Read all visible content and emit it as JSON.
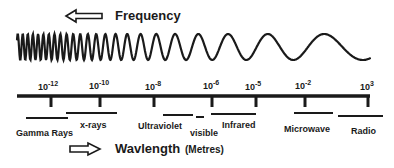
{
  "diagram": {
    "frequency_label": "Frequency",
    "wavelength_label": "Wavlength",
    "unit_label": "(Metres)",
    "frequency_arrow_direction": "left",
    "wavelength_arrow_direction": "right",
    "ticks": [
      {
        "base": "10",
        "exp": "-12"
      },
      {
        "base": "10",
        "exp": "-10"
      },
      {
        "base": "10",
        "exp": "-8"
      },
      {
        "base": "10",
        "exp": "-6"
      },
      {
        "base": "10",
        "exp": "-5"
      },
      {
        "base": "10",
        "exp": "-2"
      },
      {
        "base": "10",
        "exp": "3"
      }
    ],
    "bands": [
      {
        "label": "Gamma Rays"
      },
      {
        "label": "x-rays"
      },
      {
        "label": "Ultraviolet"
      },
      {
        "label": "visible"
      },
      {
        "label": "Infrared"
      },
      {
        "label": "Microwave"
      },
      {
        "label": "Radio"
      }
    ],
    "colors": {
      "ink": "#1a1a1a",
      "background": "#ffffff"
    }
  }
}
